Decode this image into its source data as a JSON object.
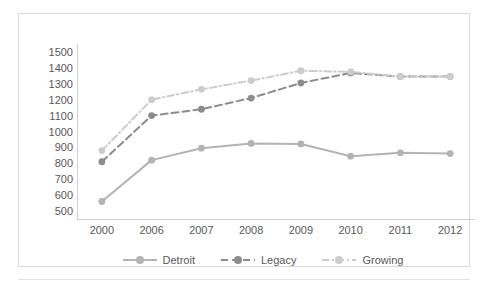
{
  "chart_data": {
    "type": "line",
    "title": "",
    "subtitle": "",
    "xlabel": "",
    "ylabel": "",
    "categories": [
      "2000",
      "2006",
      "2007",
      "2008",
      "2009",
      "2010",
      "2011",
      "2012"
    ],
    "ylim": [
      450,
      1550
    ],
    "yticks": [
      1500,
      1400,
      1300,
      1200,
      1100,
      1000,
      900,
      800,
      700,
      600,
      500
    ],
    "grid": false,
    "legend_position": "bottom",
    "series": [
      {
        "name": "Detroit",
        "color": "#b3b3b3",
        "style": "solid",
        "values": [
          560,
          820,
          895,
          925,
          922,
          845,
          866,
          861
        ]
      },
      {
        "name": "Legacy",
        "color": "#8c8c8c",
        "style": "dashed",
        "values": [
          810,
          1100,
          1140,
          1210,
          1305,
          1368,
          1345,
          1345
        ]
      },
      {
        "name": "Growing",
        "color": "#cccccc",
        "style": "dashdot",
        "values": [
          880,
          1200,
          1265,
          1320,
          1382,
          1375,
          1345,
          1345
        ]
      }
    ]
  },
  "colors": {
    "frame": "#d9d9d9",
    "axis": "#cfcfcf",
    "tick_text": "#595959",
    "background": "#ffffff"
  },
  "legend": {
    "items": [
      {
        "label": "Detroit"
      },
      {
        "label": "Legacy"
      },
      {
        "label": "Growing"
      }
    ]
  }
}
